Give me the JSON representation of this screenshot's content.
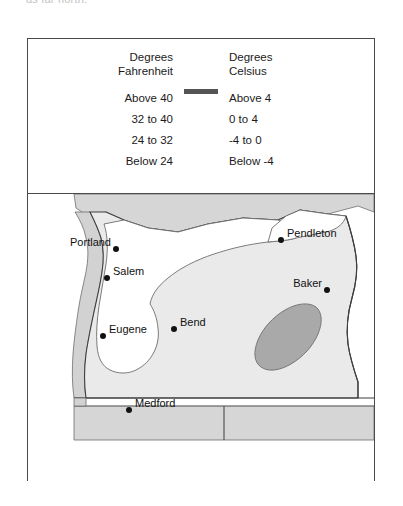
{
  "top_cut_text": "as far north.",
  "legend": {
    "fahrenheit_header": {
      "line1": "Degrees",
      "line2": "Fahrenheit"
    },
    "celsius_header": {
      "line1": "Degrees",
      "line2": "Celsius"
    },
    "rows": [
      {
        "fahrenheit": "Above 40",
        "celsius": "Above 4",
        "color": "#d2d2d2"
      },
      {
        "fahrenheit": "32 to 40",
        "celsius": "0 to 4",
        "color": "#ffffff"
      },
      {
        "fahrenheit": "24 to 32",
        "celsius": "-4 to 0",
        "color": "#eaeaea"
      },
      {
        "fahrenheit": "Below 24",
        "celsius": "Below -4",
        "color": "#a9a9a9"
      }
    ]
  },
  "map": {
    "title": "Oregon average temperature zones",
    "cities": [
      {
        "name": "Portland",
        "label_side": "left",
        "dot_x": 88,
        "dot_y": 55
      },
      {
        "name": "Salem",
        "label_side": "right",
        "dot_x": 79,
        "dot_y": 84
      },
      {
        "name": "Eugene",
        "label_side": "right",
        "dot_x": 75,
        "dot_y": 142
      },
      {
        "name": "Bend",
        "label_side": "right",
        "dot_x": 146,
        "dot_y": 135
      },
      {
        "name": "Medford",
        "label_side": "right",
        "dot_x": 101,
        "dot_y": 216
      },
      {
        "name": "Pendleton",
        "label_side": "right",
        "dot_x": 253,
        "dot_y": 46
      },
      {
        "name": "Baker",
        "label_side": "left",
        "dot_x": 299,
        "dot_y": 96
      }
    ],
    "zones": [
      {
        "name": "coastal-above-40",
        "color": "#d2d2d2"
      },
      {
        "name": "willamette-32-to-40",
        "color": "#ffffff"
      },
      {
        "name": "interior-24-to-32",
        "color": "#eaeaea"
      },
      {
        "name": "blue-mountains-below-24",
        "color": "#a9a9a9"
      }
    ],
    "colors": {
      "outline": "#3d3d3d",
      "zone_line": "#6d6d6d",
      "dot": "#111111",
      "label": "#111111"
    }
  }
}
